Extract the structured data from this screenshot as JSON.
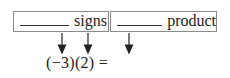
{
  "boxes": [
    {
      "blank": "________",
      "label": "signs"
    },
    {
      "blank": "________",
      "label": "product"
    }
  ],
  "expression": "(−3)(2) =",
  "arrows": [
    {
      "x": 62,
      "target": "-3"
    },
    {
      "x": 88,
      "target": "2"
    },
    {
      "x": 129,
      "target": "result"
    }
  ]
}
